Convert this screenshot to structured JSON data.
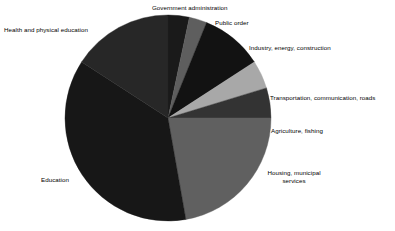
{
  "chart_data": {
    "type": "pie",
    "title": "",
    "subtitle": "",
    "xlabel": "",
    "ylabel": "",
    "legend_position": "none",
    "grid": false,
    "labels_placement": "outside-callout",
    "start_angle_deg": 0,
    "direction": "clockwise",
    "categories": [
      "Government administration",
      "Public order",
      "Industry, energy, construction",
      "Transportation, communication, roads",
      "Agriculture,  fishing",
      "Housing, municipal services",
      "Education",
      "Health and physical education"
    ],
    "values": [
      3.3,
      2.8,
      9.7,
      4.4,
      4.7,
      22.2,
      36.9,
      16.0
    ],
    "units": "percent",
    "slices": [
      {
        "label": "Government administration",
        "value": 3.3,
        "start_deg": 0,
        "end_deg": 12,
        "color": "#1a1a1a"
      },
      {
        "label": "Public order",
        "value": 2.8,
        "start_deg": 12,
        "end_deg": 22,
        "color": "#5e5e5e"
      },
      {
        "label": "Industry, energy, construction",
        "value": 9.7,
        "start_deg": 22,
        "end_deg": 57,
        "color": "#121212"
      },
      {
        "label": "Transportation, communication, roads",
        "value": 4.4,
        "start_deg": 57,
        "end_deg": 73,
        "color": "#a8a8a8"
      },
      {
        "label": "Agriculture,  fishing",
        "value": 4.7,
        "start_deg": 73,
        "end_deg": 90,
        "color": "#333333"
      },
      {
        "label": "Housing, municipal services",
        "value": 22.2,
        "start_deg": 90,
        "end_deg": 170,
        "color": "#606060"
      },
      {
        "label": "Education",
        "value": 36.9,
        "start_deg": 170,
        "end_deg": 303,
        "color": "#171717"
      },
      {
        "label": "Health and physical education",
        "value": 16.0,
        "start_deg": 303,
        "end_deg": 360,
        "color": "#272727"
      }
    ],
    "geometry": {
      "center_x": 168,
      "center_y": 118,
      "radius": 103
    }
  },
  "labels": {
    "government_administration": "Government administration",
    "public_order": "Public order",
    "industry": "Industry, energy, construction",
    "transportation": "Transportation, communication, roads",
    "agriculture": "Agriculture,  fishing",
    "housing_line1": "Housing, municipal",
    "housing_line2": "services",
    "education": "Education",
    "health": "Health and physical education"
  },
  "colors": {
    "background": "#ffffff",
    "text": "#000000",
    "slice_darkest": "#121212",
    "slice_dark": "#1a1a1a",
    "slice_medium_dark": "#333333",
    "slice_medium": "#606060",
    "slice_light": "#a8a8a8"
  }
}
